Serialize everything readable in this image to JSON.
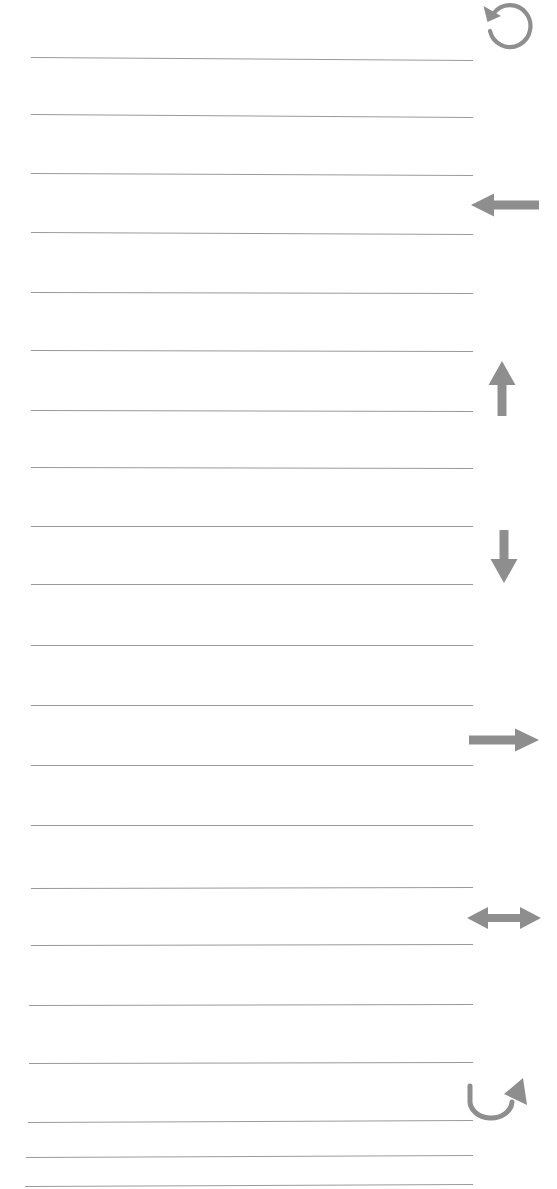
{
  "page": {
    "width": 557,
    "height": 1189,
    "background_color": "#ffffff",
    "line_color": "#9a9a9a",
    "icon_color": "#8e8e8e"
  },
  "ruled_lines": {
    "count": 21,
    "label": "ruled writing line",
    "items": [
      {
        "id": "line-1",
        "y": 57,
        "x_start": 31,
        "x_end": 473,
        "slope": 3
      },
      {
        "id": "line-2",
        "y": 114,
        "x_start": 31,
        "x_end": 473,
        "slope": 3
      },
      {
        "id": "line-3",
        "y": 173,
        "x_start": 31,
        "x_end": 473,
        "slope": 2
      },
      {
        "id": "line-4",
        "y": 232,
        "x_start": 31,
        "x_end": 473,
        "slope": 2
      },
      {
        "id": "line-5",
        "y": 292,
        "x_start": 31,
        "x_end": 473,
        "slope": 1
      },
      {
        "id": "line-6",
        "y": 350,
        "x_start": 31,
        "x_end": 473,
        "slope": 1
      },
      {
        "id": "line-7",
        "y": 410,
        "x_start": 31,
        "x_end": 473,
        "slope": 1
      },
      {
        "id": "line-8",
        "y": 467,
        "x_start": 31,
        "x_end": 473,
        "slope": 1
      },
      {
        "id": "line-9",
        "y": 526,
        "x_start": 31,
        "x_end": 473,
        "slope": 0
      },
      {
        "id": "line-10",
        "y": 584,
        "x_start": 31,
        "x_end": 473,
        "slope": 0
      },
      {
        "id": "line-11",
        "y": 645,
        "x_start": 31,
        "x_end": 473,
        "slope": 0
      },
      {
        "id": "line-12",
        "y": 705,
        "x_start": 31,
        "x_end": 473,
        "slope": 0
      },
      {
        "id": "line-13",
        "y": 765,
        "x_start": 31,
        "x_end": 473,
        "slope": 0
      },
      {
        "id": "line-14",
        "y": 825,
        "x_start": 31,
        "x_end": 473,
        "slope": 0
      },
      {
        "id": "line-15",
        "y": 888,
        "x_start": 31,
        "x_end": 473,
        "slope": -1
      },
      {
        "id": "line-16",
        "y": 945,
        "x_start": 31,
        "x_end": 473,
        "slope": -1
      },
      {
        "id": "line-17",
        "y": 1005,
        "x_start": 29,
        "x_end": 473,
        "slope": -1
      },
      {
        "id": "line-18",
        "y": 1063,
        "x_start": 29,
        "x_end": 473,
        "slope": -1
      },
      {
        "id": "line-19",
        "y": 1122,
        "x_start": 28,
        "x_end": 473,
        "slope": -2
      },
      {
        "id": "line-20",
        "y": 1157,
        "x_start": 26,
        "x_end": 473,
        "slope": -2
      },
      {
        "id": "line-21",
        "y": 1186,
        "x_start": 25,
        "x_end": 473,
        "slope": -2
      }
    ]
  },
  "margin_icons": [
    {
      "id": "icon-rotate-counterclockwise",
      "name": "rotate-counterclockwise-icon",
      "glyph": "circular arrow counter-clockwise",
      "x": 481,
      "y": 0,
      "width": 58,
      "height": 52
    },
    {
      "id": "icon-arrow-left",
      "name": "arrow-left-icon",
      "glyph": "left arrow",
      "x": 470,
      "y": 190,
      "width": 70,
      "height": 30
    },
    {
      "id": "icon-arrow-up",
      "name": "arrow-up-icon",
      "glyph": "up arrow",
      "x": 486,
      "y": 360,
      "width": 32,
      "height": 56
    },
    {
      "id": "icon-arrow-down",
      "name": "arrow-down-icon",
      "glyph": "down arrow",
      "x": 488,
      "y": 530,
      "width": 32,
      "height": 54
    },
    {
      "id": "icon-arrow-right",
      "name": "arrow-right-icon",
      "glyph": "right arrow",
      "x": 468,
      "y": 725,
      "width": 72,
      "height": 30
    },
    {
      "id": "icon-arrow-left-right",
      "name": "arrow-left-right-icon",
      "glyph": "double headed horizontal arrow",
      "x": 466,
      "y": 902,
      "width": 76,
      "height": 32
    },
    {
      "id": "icon-arrow-u-turn-up",
      "name": "arrow-u-turn-up-icon",
      "glyph": "curved u-turn arrow pointing up-right",
      "x": 466,
      "y": 1074,
      "width": 66,
      "height": 50
    }
  ]
}
